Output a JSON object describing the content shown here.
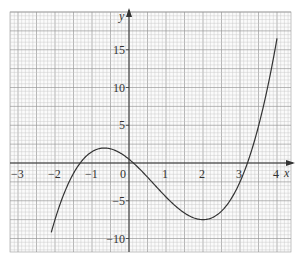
{
  "chart_data": {
    "type": "line",
    "title": "",
    "xlabel": "x",
    "ylabel": "y",
    "xlim": [
      -3.2,
      4.3
    ],
    "ylim": [
      -11.5,
      20.5
    ],
    "grid": true,
    "x_ticks": [
      "-3",
      "-2",
      "-1",
      "0",
      "1",
      "2",
      "3",
      "4"
    ],
    "y_ticks": [
      "15",
      "10",
      "5",
      "-5",
      "-10"
    ],
    "series": [
      {
        "name": "y = x^3 - 2x^2 - 4x + 0.5",
        "x": [
          -2.1,
          -2.0,
          -1.5,
          -1.0,
          -0.67,
          -0.5,
          0.0,
          0.5,
          1.0,
          1.5,
          2.0,
          2.5,
          3.0,
          3.5,
          4.0
        ],
        "values": [
          -9.2,
          -7.5,
          -1.5,
          1.5,
          2.0,
          1.9,
          0.5,
          -1.6,
          -4.5,
          -6.6,
          -7.5,
          -6.4,
          -2.5,
          4.9,
          16.5
        ]
      }
    ],
    "annotations": {
      "local_max": [
        -0.67,
        2.0
      ],
      "local_min": [
        2.0,
        -7.5
      ],
      "roots": [
        -1.4,
        0.13,
        3.3
      ]
    }
  },
  "colors": {
    "grid_minor": "#c8c8c8",
    "grid_major": "#9a9a9a",
    "axis": "#333333",
    "curve": "#333333"
  }
}
